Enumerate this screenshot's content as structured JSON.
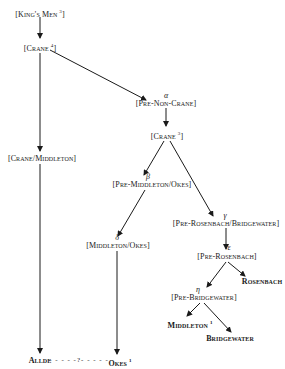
{
  "diagram": {
    "type": "stemma",
    "nodes": {
      "kings_men": {
        "label": "[King's Men",
        "sup": "3"
      },
      "crane4": {
        "label": "[Crane",
        "sup": "4",
        "close": "]"
      },
      "crane_middleton": {
        "label": "[Crane/Middleton]"
      },
      "pre_non_crane": {
        "greek": "α",
        "label": "[Pre-Non-Crane]"
      },
      "crane3": {
        "label": "[Crane",
        "sup": "3",
        "close": "]"
      },
      "pre_middleton_okes": {
        "greek": "β",
        "label": "[Pre-Middleton/Okes]"
      },
      "pre_rosenbach_bridgewater": {
        "greek": "γ",
        "label": "[Pre-Rosenbach/Bridgewater]"
      },
      "middleton_okes": {
        "greek": "δ",
        "label": "[Middleton/Okes]"
      },
      "pre_rosenbach": {
        "greek": "ε",
        "label": "[Pre-Rosenbach]"
      },
      "rosenbach": {
        "label": "Rosenbach"
      },
      "pre_bridgewater": {
        "greek": "η",
        "label": "[Pre-Bridgewater]"
      },
      "middleton1": {
        "label": "Middleton",
        "sup": "1"
      },
      "bridgewater": {
        "label": "Bridgewater"
      },
      "allde": {
        "label": "Allde"
      },
      "okes1": {
        "label": "Okes",
        "sup": "1"
      },
      "uncertain_link": {
        "label": "- - - - -?- - - - -"
      }
    },
    "edges": [
      [
        "kings_men",
        "crane4"
      ],
      [
        "crane4",
        "crane_middleton"
      ],
      [
        "crane4",
        "pre_non_crane"
      ],
      [
        "crane_middleton",
        "allde"
      ],
      [
        "pre_non_crane",
        "crane3"
      ],
      [
        "crane3",
        "pre_middleton_okes"
      ],
      [
        "crane3",
        "pre_rosenbach_bridgewater"
      ],
      [
        "pre_middleton_okes",
        "middleton_okes"
      ],
      [
        "middleton_okes",
        "okes1"
      ],
      [
        "pre_rosenbach_bridgewater",
        "pre_rosenbach"
      ],
      [
        "pre_rosenbach",
        "rosenbach"
      ],
      [
        "pre_rosenbach",
        "pre_bridgewater"
      ],
      [
        "pre_bridgewater",
        "middleton1"
      ],
      [
        "pre_bridgewater",
        "bridgewater"
      ]
    ],
    "colors": {
      "line": "#1a1a1a",
      "text": "#1a1a1a",
      "background": "#ffffff"
    }
  }
}
